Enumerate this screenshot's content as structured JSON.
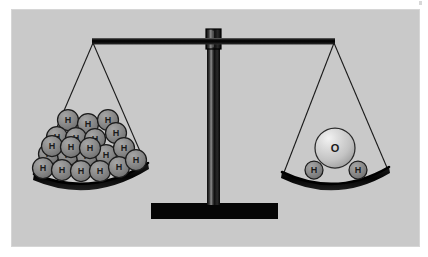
{
  "figure": {
    "background_color": "#c9c9c9",
    "page_color": "#ffffff",
    "border_color": "#d6d6d6",
    "structure_color": "#0a0a0a",
    "atom_fill_h": "#8a8a8a",
    "atom_stroke_h": "#1c1c1c",
    "atom_fill_o": "#cfcfcf",
    "atom_stroke_o": "#2a2a2a",
    "string_color": "#1a1a1a"
  },
  "balance": {
    "beam_label": "balance-beam",
    "pillar_label": "balance-pillar",
    "base_label": "balance-base",
    "pivot_label": "balance-pivot",
    "state": "level"
  },
  "left_pan": {
    "name": "left-pan",
    "atom_label": "H",
    "atom_count": 21,
    "element": "hydrogen",
    "atom_radius": 10.5,
    "atoms": [
      {
        "x": 68,
        "y": 120
      },
      {
        "x": 88,
        "y": 124
      },
      {
        "x": 108,
        "y": 120
      },
      {
        "x": 57,
        "y": 137
      },
      {
        "x": 76,
        "y": 138
      },
      {
        "x": 95,
        "y": 139
      },
      {
        "x": 116,
        "y": 133
      },
      {
        "x": 49,
        "y": 154
      },
      {
        "x": 68,
        "y": 155
      },
      {
        "x": 87,
        "y": 156
      },
      {
        "x": 106,
        "y": 155
      },
      {
        "x": 124,
        "y": 148
      },
      {
        "x": 43,
        "y": 168
      },
      {
        "x": 62,
        "y": 170
      },
      {
        "x": 81,
        "y": 171
      },
      {
        "x": 100,
        "y": 171
      },
      {
        "x": 119,
        "y": 167
      },
      {
        "x": 136,
        "y": 160
      },
      {
        "x": 52,
        "y": 146
      },
      {
        "x": 71,
        "y": 147
      },
      {
        "x": 90,
        "y": 148
      }
    ]
  },
  "right_pan": {
    "name": "right-pan",
    "oxygen": {
      "label": "O",
      "element": "oxygen",
      "x": 335,
      "y": 148,
      "radius": 20
    },
    "hydrogens": [
      {
        "label": "H",
        "x": 314,
        "y": 170,
        "radius": 9
      },
      {
        "label": "H",
        "x": 358,
        "y": 170,
        "radius": 9
      }
    ],
    "atom_count": 3
  },
  "annotations": {
    "alt_text": "A two-pan balance scale is level. The left pan holds many small gray hydrogen atoms labeled H. The right pan holds one large light gray oxygen atom labeled O flanked by two small hydrogen atoms labeled H."
  }
}
